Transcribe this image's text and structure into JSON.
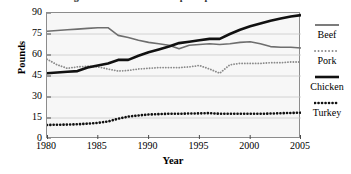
{
  "chart_data": {
    "type": "line",
    "title": "Average Annual Meat Consumption per Person in the U.S.",
    "xlabel": "Year",
    "ylabel": "Pounds",
    "xlim": [
      1980,
      2005
    ],
    "ylim": [
      0,
      90
    ],
    "xticks": [
      1980,
      1985,
      1990,
      1995,
      2000,
      2005
    ],
    "yticks": [
      0,
      15,
      30,
      45,
      60,
      75,
      90
    ],
    "grid": true,
    "legend_position": "right",
    "x": [
      1980,
      1981,
      1982,
      1983,
      1984,
      1985,
      1986,
      1987,
      1988,
      1989,
      1990,
      1991,
      1992,
      1993,
      1994,
      1995,
      1996,
      1997,
      1998,
      1999,
      2000,
      2001,
      2002,
      2003,
      2004,
      2005
    ],
    "series": [
      {
        "name": "Beef",
        "color": "#6e6e6e",
        "style": "solid",
        "width": 1.6,
        "values": [
          77,
          77.5,
          78,
          78.5,
          79,
          79.5,
          79.5,
          74,
          72.5,
          70.5,
          69,
          68,
          67,
          64.5,
          67,
          67.5,
          68,
          67.5,
          68,
          69,
          69.5,
          68,
          66,
          65.5,
          65.5,
          65
        ]
      },
      {
        "name": "Pork",
        "color": "#8a8a8a",
        "style": "dotted",
        "width": 1.8,
        "values": [
          57,
          53,
          50.5,
          51.5,
          52,
          51.5,
          50,
          48.5,
          49,
          50,
          50.5,
          51,
          51,
          51,
          51.5,
          52.5,
          50,
          47,
          53,
          54,
          54,
          54,
          54.5,
          54.5,
          55,
          55
        ]
      },
      {
        "name": "Chicken",
        "color": "#111111",
        "style": "solid",
        "width": 2.6,
        "values": [
          47,
          47.5,
          48,
          48.5,
          51,
          52.5,
          54,
          56.5,
          56.5,
          59.5,
          62,
          64,
          66,
          68.5,
          69.5,
          70.5,
          71.5,
          71.5,
          75,
          78,
          80.5,
          82.5,
          84.5,
          86,
          87.5,
          88.5
        ]
      },
      {
        "name": "Turkey",
        "color": "#111111",
        "style": "dotted",
        "width": 2.6,
        "values": [
          10,
          10.2,
          10.3,
          10.5,
          11,
          11.5,
          12.5,
          14.5,
          16,
          16.8,
          17.5,
          17.8,
          18,
          18,
          18.2,
          18.3,
          18.5,
          18,
          18,
          18,
          18,
          18,
          18.2,
          18.4,
          18.6,
          18.8
        ]
      }
    ]
  },
  "legend": {
    "entries": [
      {
        "label": "Beef"
      },
      {
        "label": "Pork"
      },
      {
        "label": "Chicken"
      },
      {
        "label": "Turkey"
      }
    ]
  }
}
